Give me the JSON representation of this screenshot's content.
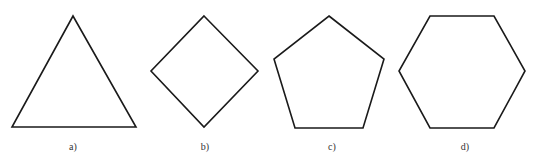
{
  "figure": {
    "stroke_color": "#1a1a1a",
    "background": "#ffffff",
    "shapes": [
      {
        "name": "triangle",
        "label": "a)",
        "points": "73,16 12,127 136,127",
        "label_x": 73
      },
      {
        "name": "square-rotated",
        "label": "b)",
        "points": "204,16 258,71 204,127 151,71",
        "label_x": 205
      },
      {
        "name": "pentagon",
        "label": "c)",
        "points": "329,16 384,59 363,128 295,128 274,59",
        "label_x": 332
      },
      {
        "name": "hexagon",
        "label": "d)",
        "points": "430,16 494,16 525,71 494,128 430,128 399,71",
        "label_x": 465
      }
    ]
  }
}
